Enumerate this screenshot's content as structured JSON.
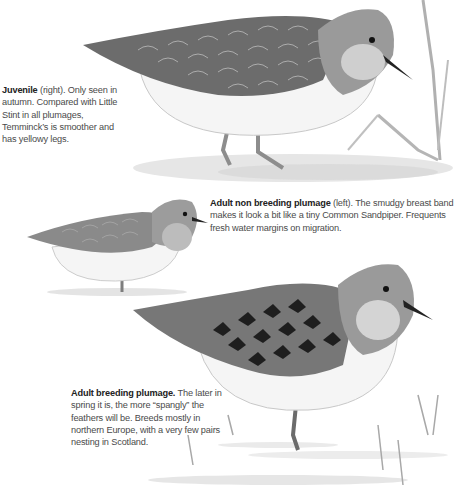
{
  "plates": [
    {
      "id": "juvenile",
      "title": "Juvenile",
      "text": " (right). Only seen in autumn. Compared with Little Stint in all plumages, Temminck’s is smoother and has yellowy legs."
    },
    {
      "id": "adult-non-breeding",
      "title": "Adult non breeding plumage",
      "text": " (left). The smudgy breast band makes it look a bit like a tiny Common Sandpiper. Frequents fresh water margins on migration."
    },
    {
      "id": "adult-breeding",
      "title": "Adult breeding plumage.",
      "text": " The later in spring it is, the more “spangly” the feathers will be. Breeds mostly in northern Europe, with a very few pairs nesting in Scotland."
    }
  ],
  "colors": {
    "ink": "#222222",
    "text": "#4a4a4a",
    "wing_dark": "#5a5a5a",
    "wing_mid": "#8a8a8a",
    "belly": "#f4f4f4"
  }
}
